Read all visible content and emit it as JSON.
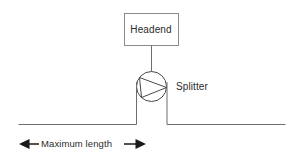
{
  "diagram": {
    "background_color": "#ffffff",
    "line_color": "#6d6d6d",
    "text_color": "#2b2b2b",
    "dimension_color": "#1a1a1a",
    "nodes": {
      "headend": {
        "label": "Headend",
        "shape": "rectangle",
        "x": 124,
        "y": 13,
        "width": 54,
        "height": 33
      },
      "splitter": {
        "label": "Splitter",
        "shape": "circle-with-triangle",
        "center_x": 151,
        "center_y": 86,
        "radius": 15
      }
    },
    "connectors": [
      {
        "name": "headend-to-splitter",
        "from": "headend",
        "to": "splitter",
        "orientation": "vertical"
      },
      {
        "name": "splitter-left-drop",
        "from": "splitter",
        "to": "left-baseline",
        "orientation": "vertical"
      },
      {
        "name": "splitter-right-drop",
        "from": "splitter",
        "to": "right-baseline",
        "orientation": "vertical"
      },
      {
        "name": "left-baseline",
        "orientation": "horizontal"
      },
      {
        "name": "right-baseline",
        "orientation": "horizontal"
      }
    ],
    "dimension": {
      "label": "Maximum length",
      "arrow_style": "double-headed",
      "left_arrow": "◀",
      "right_arrow": "▶"
    }
  }
}
